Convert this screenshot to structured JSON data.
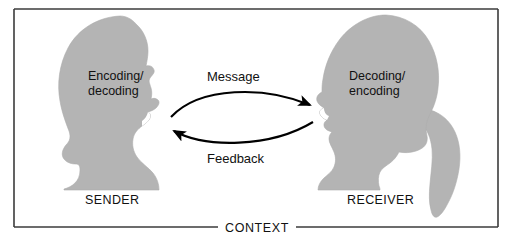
{
  "diagram": {
    "frame": {
      "border_color": "#3b3b3b",
      "background_color": "#ffffff"
    },
    "colors": {
      "silhouette": "#b4b4b4",
      "silhouette_edge": "#a9a9a9",
      "text": "#111111",
      "arrow": "#000000",
      "border": "#3b3b3b"
    },
    "sender": {
      "role_label": "SENDER",
      "process_label_line1": "Encoding/",
      "process_label_line2": "decoding",
      "figure_name": "male-head-silhouette"
    },
    "receiver": {
      "role_label": "RECEIVER",
      "process_label_line1": "Decoding/",
      "process_label_line2": "encoding",
      "figure_name": "female-head-silhouette"
    },
    "arrows": [
      {
        "id": "message",
        "label": "Message",
        "direction": "sender-to-receiver",
        "position": "top"
      },
      {
        "id": "feedback",
        "label": "Feedback",
        "direction": "receiver-to-sender",
        "position": "bottom"
      }
    ],
    "context": {
      "label": "CONTEXT",
      "position": "bottom-border-center"
    }
  }
}
